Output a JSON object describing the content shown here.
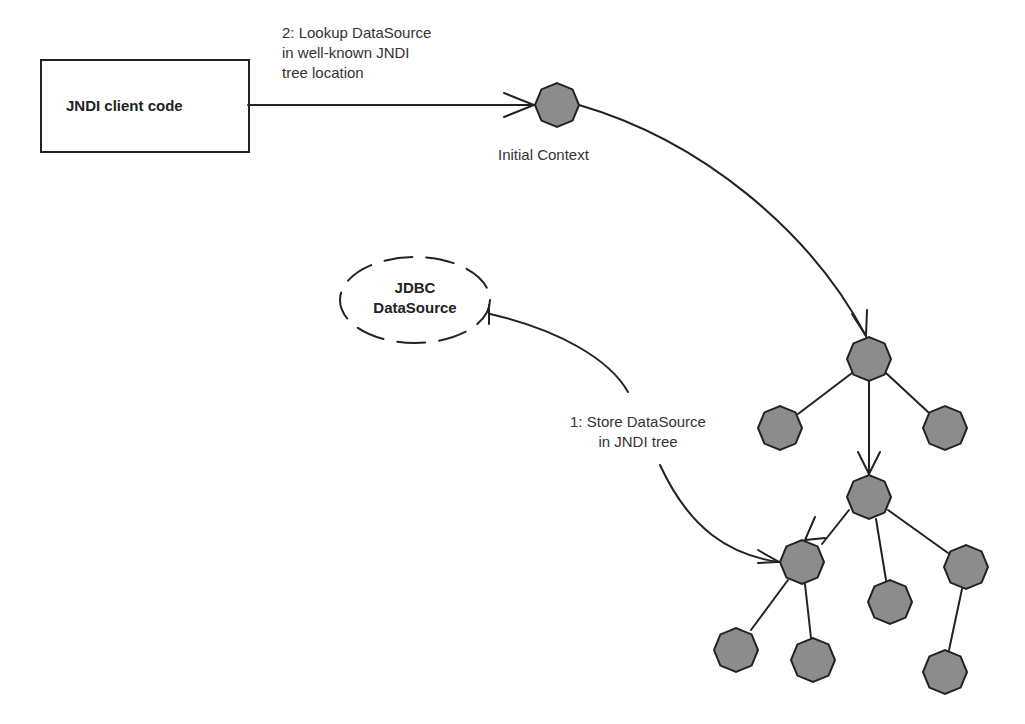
{
  "diagram": {
    "client_box": {
      "label": "JNDI client code"
    },
    "lookup_arrow": {
      "label_lines": [
        "2: Lookup DataSource",
        "in well-known JNDI",
        "tree location"
      ]
    },
    "initial_context": {
      "label": "Initial Context"
    },
    "datasource": {
      "label_lines": [
        "JDBC",
        "DataSource"
      ]
    },
    "store_arrow": {
      "label_lines": [
        "1: Store DataSource",
        "in JNDI tree"
      ]
    },
    "colors": {
      "node_fill": "#8c8c8c",
      "stroke": "#222222",
      "text": "#333333",
      "background": "#ffffff"
    },
    "tree_nodes": [
      {
        "id": "root",
        "x": 869,
        "y": 359
      },
      {
        "id": "root-left",
        "x": 780,
        "y": 428
      },
      {
        "id": "root-right",
        "x": 945,
        "y": 428
      },
      {
        "id": "mid",
        "x": 869,
        "y": 497
      },
      {
        "id": "mid-left",
        "x": 802,
        "y": 562
      },
      {
        "id": "mid-center",
        "x": 890,
        "y": 602
      },
      {
        "id": "mid-right",
        "x": 966,
        "y": 567
      },
      {
        "id": "leaf-1",
        "x": 736,
        "y": 650
      },
      {
        "id": "leaf-2",
        "x": 813,
        "y": 660
      },
      {
        "id": "leaf-3",
        "x": 945,
        "y": 672
      }
    ]
  }
}
